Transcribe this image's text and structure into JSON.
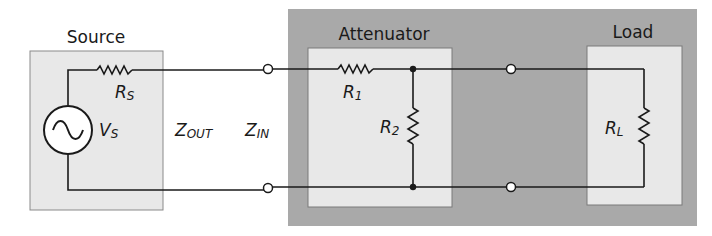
{
  "diagram": {
    "type": "circuit-schematic",
    "blocks": {
      "source": {
        "title": "Source",
        "fill": "#e8e8e8"
      },
      "attenuator": {
        "title": "Attenuator",
        "fill": "#e8e8e8"
      },
      "load": {
        "title": "Load",
        "fill": "#e8e8e8"
      },
      "outer_group": {
        "fill": "#a9a9a9"
      }
    },
    "components": {
      "rs": {
        "symbol": "R",
        "subscript": "S"
      },
      "vs": {
        "symbol": "V",
        "subscript": "S"
      },
      "r1": {
        "symbol": "R",
        "subscript": "1"
      },
      "r2": {
        "symbol": "R",
        "subscript": "2"
      },
      "rl": {
        "symbol": "R",
        "subscript": "L"
      }
    },
    "impedances": {
      "zout": {
        "symbol": "Z",
        "subscript": "OUT"
      },
      "zin": {
        "symbol": "Z",
        "subscript": "IN"
      }
    },
    "colors": {
      "wire": "#1a1a1a",
      "outer": "#a9a9a9",
      "inner": "#e8e8e8",
      "border": "#8a8a8a"
    }
  }
}
